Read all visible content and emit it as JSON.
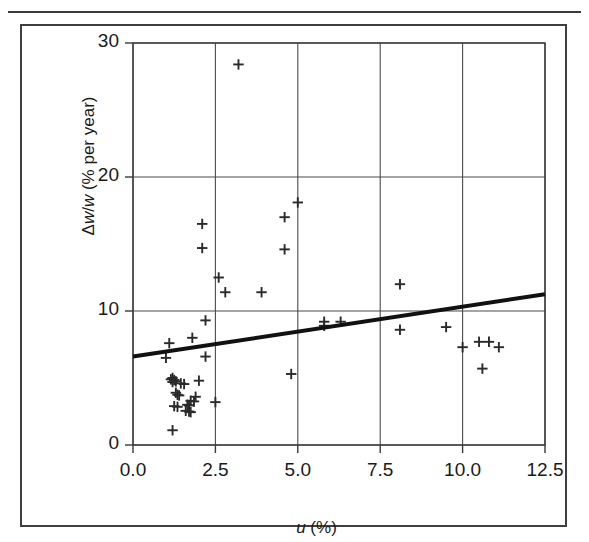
{
  "chart_data": {
    "type": "scatter",
    "title": "",
    "xlabel": "u (%)",
    "ylabel": "Δw/w (% per year)",
    "xlabel_parts": {
      "symbol": "u",
      "unit": " (%)"
    },
    "ylabel_parts": {
      "delta": "Δ",
      "w1": "w",
      "slash": "/",
      "w2": "w",
      "unit": " (% per year)"
    },
    "xlim": [
      0.0,
      12.5
    ],
    "ylim": [
      0,
      30
    ],
    "xticks": [
      "0.0",
      "2.5",
      "5.0",
      "7.5",
      "10.0",
      "12.5"
    ],
    "xtick_values": [
      0.0,
      2.5,
      5.0,
      7.5,
      10.0,
      12.5
    ],
    "yticks": [
      "0",
      "10",
      "20",
      "30"
    ],
    "ytick_values": [
      0,
      10,
      20,
      30
    ],
    "grid": true,
    "grid_color": "#4a4a4a",
    "legend": null,
    "marker": "plus",
    "marker_color": "#2a2a2a",
    "trendline": {
      "color": "#111111",
      "width": 4,
      "x0": 0.0,
      "y0": 6.6,
      "x1": 12.5,
      "y1": 11.25
    },
    "points": [
      [
        3.2,
        28.4
      ],
      [
        5.0,
        18.1
      ],
      [
        4.6,
        17.0
      ],
      [
        2.1,
        16.5
      ],
      [
        2.1,
        14.7
      ],
      [
        4.6,
        14.6
      ],
      [
        2.6,
        12.5
      ],
      [
        8.1,
        12.0
      ],
      [
        2.8,
        11.4
      ],
      [
        3.9,
        11.4
      ],
      [
        2.2,
        9.3
      ],
      [
        5.8,
        9.2
      ],
      [
        6.3,
        9.2
      ],
      [
        5.8,
        8.9
      ],
      [
        9.5,
        8.8
      ],
      [
        8.1,
        8.6
      ],
      [
        1.8,
        8.0
      ],
      [
        1.1,
        7.6
      ],
      [
        10.5,
        7.7
      ],
      [
        10.8,
        7.7
      ],
      [
        10.0,
        7.3
      ],
      [
        11.1,
        7.3
      ],
      [
        2.2,
        6.6
      ],
      [
        1.0,
        6.5
      ],
      [
        10.6,
        5.7
      ],
      [
        4.8,
        5.3
      ],
      [
        1.2,
        5.0
      ],
      [
        1.15,
        4.9
      ],
      [
        1.25,
        4.85
      ],
      [
        1.3,
        4.75
      ],
      [
        1.2,
        4.7
      ],
      [
        1.45,
        4.6
      ],
      [
        1.55,
        4.55
      ],
      [
        2.0,
        4.8
      ],
      [
        1.3,
        3.9
      ],
      [
        1.35,
        3.75
      ],
      [
        1.4,
        3.7
      ],
      [
        1.9,
        3.6
      ],
      [
        1.75,
        3.3
      ],
      [
        1.85,
        3.25
      ],
      [
        1.25,
        2.9
      ],
      [
        1.35,
        2.85
      ],
      [
        1.65,
        3.0
      ],
      [
        1.7,
        2.95
      ],
      [
        1.6,
        2.55
      ],
      [
        1.7,
        2.5
      ],
      [
        1.75,
        2.45
      ],
      [
        2.5,
        3.2
      ],
      [
        1.2,
        1.1
      ]
    ]
  }
}
